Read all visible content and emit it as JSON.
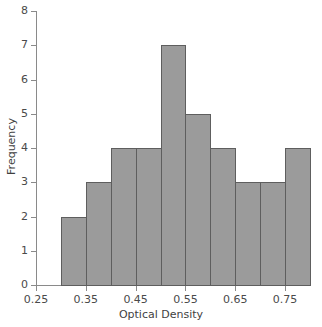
{
  "chart_data": {
    "type": "bar",
    "title": "",
    "subtitle": "",
    "xlabel": "Optical Density",
    "ylabel": "Frequency",
    "xlim": [
      0.25,
      0.8
    ],
    "ylim": [
      0,
      8
    ],
    "grid": false,
    "legend": null,
    "bin_width": 0.05,
    "bin_edges": [
      0.3,
      0.35,
      0.4,
      0.45,
      0.5,
      0.55,
      0.6,
      0.65,
      0.7,
      0.75,
      0.8
    ],
    "categories": [
      "0.30-0.35",
      "0.35-0.40",
      "0.40-0.45",
      "0.45-0.50",
      "0.50-0.55",
      "0.55-0.60",
      "0.60-0.65",
      "0.65-0.70",
      "0.70-0.75",
      "0.75-0.80"
    ],
    "values": [
      2,
      3,
      4,
      4,
      7,
      5,
      4,
      3,
      3,
      4
    ],
    "total_count": 39,
    "xticks": [
      0.25,
      0.35,
      0.45,
      0.55,
      0.65,
      0.75
    ],
    "xtick_labels": [
      "0.25",
      "0.35",
      "0.45",
      "0.55",
      "0.65",
      "0.75"
    ],
    "yticks": [
      0,
      1,
      2,
      3,
      4,
      5,
      6,
      7,
      8
    ],
    "ytick_labels": [
      "0",
      "1",
      "2",
      "3",
      "4",
      "5",
      "6",
      "7",
      "8"
    ],
    "bar_fill_color": "#9b9b9b",
    "bar_edge_color": "#5e5e5e",
    "axis_color": "#8a8a8a",
    "text_color": "#4a4a4a",
    "background_color": "#ffffff"
  }
}
